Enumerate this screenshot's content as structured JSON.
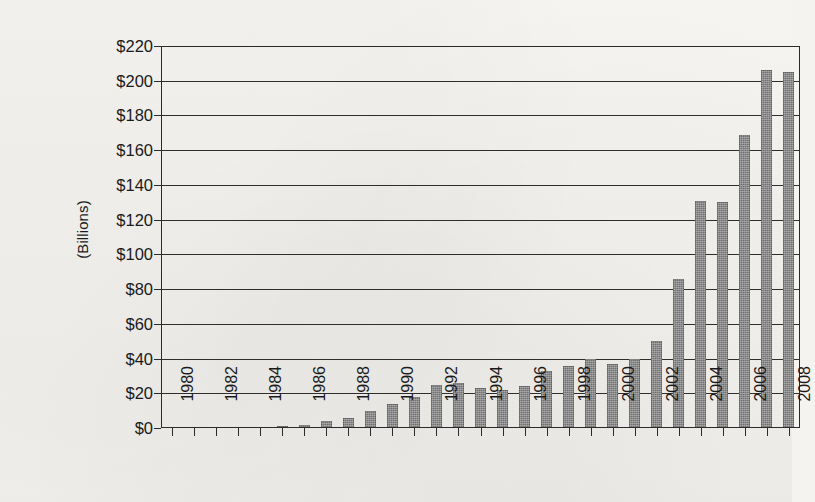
{
  "chart_data": {
    "type": "bar",
    "title": "",
    "subtitle": "",
    "xlabel": "",
    "ylabel": "(Billions)",
    "grid": true,
    "legend": false,
    "legend_position": "none",
    "bar_color": "#7d7d7d",
    "axis_color": "#2b2b2b",
    "background_color": "#f4f3f0",
    "ylim": [
      0,
      220
    ],
    "ytick_step": 20,
    "ytick_labels": [
      "$0",
      "$20",
      "$40",
      "$60",
      "$80",
      "$100",
      "$120",
      "$140",
      "$160",
      "$180",
      "$200",
      "$220"
    ],
    "ytick_values": [
      0,
      20,
      40,
      60,
      80,
      100,
      120,
      140,
      160,
      180,
      200,
      220
    ],
    "xlim": [
      1980,
      2008
    ],
    "xtick_label_step": 2,
    "xtick_labels": [
      "1980",
      "1982",
      "1984",
      "1986",
      "1988",
      "1990",
      "1992",
      "1994",
      "1996",
      "1998",
      "2000",
      "2002",
      "2004",
      "2006",
      "2008"
    ],
    "categories": [
      "1980",
      "1981",
      "1982",
      "1983",
      "1984",
      "1985",
      "1986",
      "1987",
      "1988",
      "1989",
      "1990",
      "1991",
      "1992",
      "1993",
      "1994",
      "1995",
      "1996",
      "1997",
      "1998",
      "1999",
      "2000",
      "2001",
      "2002",
      "2003",
      "2004",
      "2005",
      "2006",
      "2007",
      "2008"
    ],
    "values": [
      0,
      0,
      0,
      0,
      0.5,
      1,
      2,
      4,
      6,
      10,
      14,
      18,
      25,
      26,
      23,
      22,
      24,
      33,
      36,
      40,
      37,
      40,
      50,
      86,
      131,
      130,
      169,
      206,
      205
    ]
  }
}
